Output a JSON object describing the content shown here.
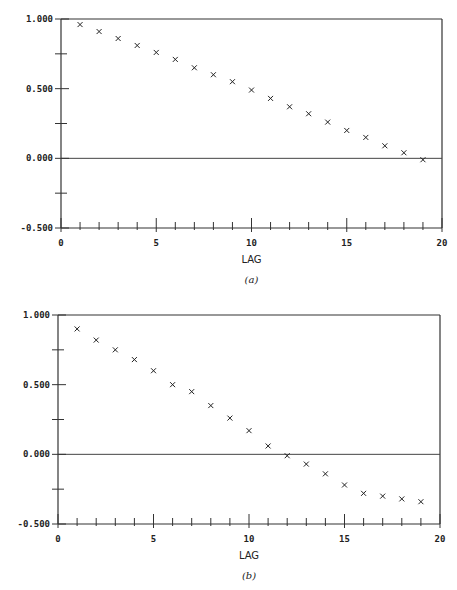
{
  "chart_data": [
    {
      "type": "scatter",
      "title": "",
      "caption": "(a)",
      "xlabel": "LAG",
      "ylabel": "",
      "xlim": [
        0,
        20
      ],
      "ylim": [
        -0.5,
        1.0
      ],
      "x_ticks": [
        "0",
        "5",
        "10",
        "15",
        "20"
      ],
      "y_ticks": [
        "1.000",
        "0.500",
        "0.000",
        "-0.500"
      ],
      "marker": "x",
      "grid": false,
      "reference_line_y": 0.0,
      "x": [
        1,
        2,
        3,
        4,
        5,
        6,
        7,
        8,
        9,
        10,
        11,
        12,
        13,
        14,
        15,
        16,
        17,
        18,
        19
      ],
      "values": [
        0.96,
        0.91,
        0.86,
        0.81,
        0.76,
        0.71,
        0.65,
        0.6,
        0.55,
        0.49,
        0.43,
        0.37,
        0.32,
        0.26,
        0.2,
        0.15,
        0.09,
        0.04,
        -0.01
      ],
      "layout": {
        "left": 61,
        "right": 442,
        "top": 19,
        "bottom": 228
      }
    },
    {
      "type": "scatter",
      "title": "",
      "caption": "(b)",
      "xlabel": "LAG",
      "ylabel": "",
      "xlim": [
        0,
        20
      ],
      "ylim": [
        -0.5,
        1.0
      ],
      "x_ticks": [
        "0",
        "5",
        "10",
        "15",
        "20"
      ],
      "y_ticks": [
        "1.000",
        "0.500",
        "0.000",
        "-0.500"
      ],
      "marker": "x",
      "grid": false,
      "reference_line_y": 0.0,
      "x": [
        1,
        2,
        3,
        4,
        5,
        6,
        7,
        8,
        9,
        10,
        11,
        12,
        13,
        14,
        15,
        16,
        17,
        18,
        19
      ],
      "values": [
        0.9,
        0.82,
        0.75,
        0.68,
        0.6,
        0.5,
        0.45,
        0.35,
        0.26,
        0.17,
        0.06,
        -0.01,
        -0.07,
        -0.14,
        -0.22,
        -0.28,
        -0.3,
        -0.32,
        -0.34
      ],
      "layout": {
        "left": 58,
        "right": 440,
        "top": 315,
        "bottom": 524
      }
    }
  ]
}
